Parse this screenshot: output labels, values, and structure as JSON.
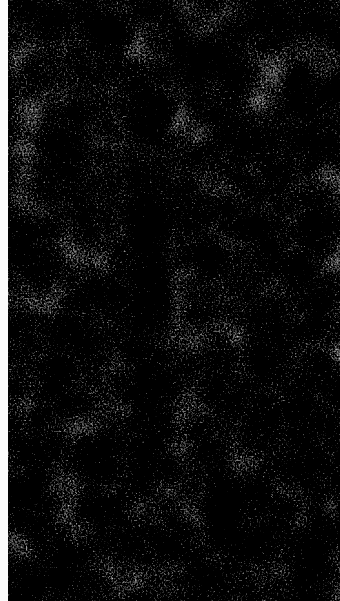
{
  "image": {
    "description": "Grayscale fibrous noise texture",
    "width": 340,
    "height": 601,
    "left_strip_width": 8,
    "colors": {
      "strip": "#fbfbfb",
      "dark": "#1e1e1e",
      "light": "#f0f0f0"
    }
  }
}
